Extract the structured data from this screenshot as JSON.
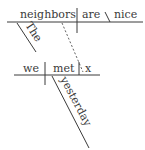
{
  "diagram": {
    "type": "sentence-diagram",
    "main_clause": {
      "subject": "neighbors",
      "subject_modifier": "The",
      "verb": "are",
      "predicate_adjective": "nice"
    },
    "relative_clause": {
      "subject": "we",
      "verb": "met",
      "object": "x",
      "adverb": "yesterday"
    },
    "colors": {
      "ink": "#3a3a3a",
      "background": "#ffffff"
    }
  }
}
